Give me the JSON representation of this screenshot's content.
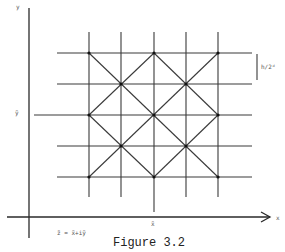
{
  "figure": {
    "caption": "Figure 3.2",
    "axis_x_label": "x",
    "axis_y_label": "y",
    "x_tilde_label": "x̃",
    "y_tilde_label": "ỹ",
    "spacing_label": "h/2ᵈ",
    "formula": "z̃ = x̃+iỹ",
    "line_color": "#3a3a3a",
    "background": "#ffffff"
  },
  "grid": {
    "columns_x": [
      89,
      121,
      154,
      186,
      218
    ],
    "rows_y": [
      53,
      84,
      115,
      146,
      177
    ],
    "center_column_index": 2,
    "center_row_index": 2,
    "description": "5x5 square grid with full diamond (diagonal) lattice; node dots at diamond vertices"
  }
}
